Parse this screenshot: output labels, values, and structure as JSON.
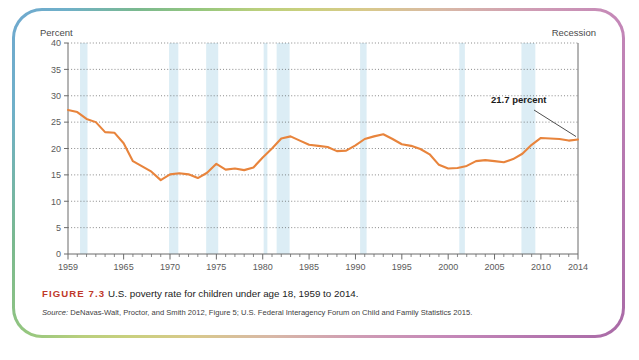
{
  "figure": {
    "label": "FIGURE 7.3",
    "caption": "U.S. poverty rate for children under age 18, 1959 to 2014.",
    "source_prefix": "Source:",
    "source_text": "DeNavas-Walt, Proctor, and Smith 2012, Figure 5; U.S. Federal Interagency Forum on Child and Family Statistics 2015."
  },
  "legend": {
    "recession_label": "Recession"
  },
  "annotation": {
    "final_value_label": "21.7 percent"
  },
  "colors": {
    "line": "#E8843C",
    "recession_band": "#DCEDF5",
    "gridline": "#555555",
    "axis": "#6b6b6b",
    "figure_label": "#C0392B",
    "border_start": "#6FA8CF",
    "border_mid": "#C9D07E",
    "border_end": "#A96AA6"
  },
  "chart_data": {
    "type": "line",
    "title": "U.S. poverty rate for children under age 18, 1959 to 2014",
    "xlabel": "",
    "ylabel": "Percent",
    "ylim": [
      0,
      40
    ],
    "xlim": [
      1959,
      2014
    ],
    "ytick_labels": [
      "0",
      "5",
      "10",
      "15",
      "20",
      "25",
      "30",
      "35",
      "40"
    ],
    "yticks": [
      0,
      5,
      10,
      15,
      20,
      25,
      30,
      35,
      40
    ],
    "xtick_labels": [
      "1959",
      "1965",
      "1970",
      "1975",
      "1980",
      "1985",
      "1990",
      "1995",
      "2000",
      "2005",
      "2010",
      "2014"
    ],
    "xticks": [
      1959,
      1965,
      1970,
      1975,
      1980,
      1985,
      1990,
      1995,
      2000,
      2005,
      2010,
      2014
    ],
    "grid": true,
    "grid_style": "dotted-horizontal",
    "legend_position": "top-right",
    "x": [
      1959,
      1960,
      1961,
      1962,
      1963,
      1964,
      1965,
      1966,
      1967,
      1968,
      1969,
      1970,
      1971,
      1972,
      1973,
      1974,
      1975,
      1976,
      1977,
      1978,
      1979,
      1980,
      1981,
      1982,
      1983,
      1984,
      1985,
      1986,
      1987,
      1988,
      1989,
      1990,
      1991,
      1992,
      1993,
      1994,
      1995,
      1996,
      1997,
      1998,
      1999,
      2000,
      2001,
      2002,
      2003,
      2004,
      2005,
      2006,
      2007,
      2008,
      2009,
      2010,
      2011,
      2012,
      2013,
      2014
    ],
    "values": [
      27.3,
      26.9,
      25.6,
      25.0,
      23.1,
      23.0,
      21.0,
      17.6,
      16.6,
      15.6,
      14.0,
      15.1,
      15.3,
      15.1,
      14.4,
      15.4,
      17.1,
      16.0,
      16.2,
      15.9,
      16.4,
      18.3,
      20.0,
      21.9,
      22.3,
      21.5,
      20.7,
      20.5,
      20.3,
      19.5,
      19.6,
      20.6,
      21.8,
      22.3,
      22.7,
      21.8,
      20.8,
      20.5,
      19.9,
      18.9,
      16.9,
      16.2,
      16.3,
      16.7,
      17.6,
      17.8,
      17.6,
      17.4,
      18.0,
      19.0,
      20.7,
      22.0,
      21.9,
      21.8,
      21.5,
      21.7
    ],
    "series_name": "Child poverty rate",
    "final_value": 21.7,
    "recession_bands": [
      {
        "start": 1960.3,
        "end": 1961.1
      },
      {
        "start": 1969.9,
        "end": 1970.9
      },
      {
        "start": 1973.9,
        "end": 1975.2
      },
      {
        "start": 1980.1,
        "end": 1980.5
      },
      {
        "start": 1981.5,
        "end": 1982.9
      },
      {
        "start": 1990.5,
        "end": 1991.2
      },
      {
        "start": 2001.2,
        "end": 2001.8
      },
      {
        "start": 2007.9,
        "end": 2009.4
      }
    ]
  }
}
